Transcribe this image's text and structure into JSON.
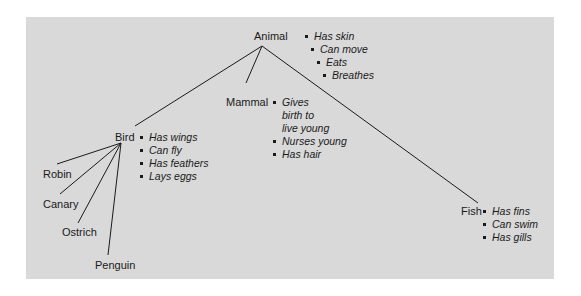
{
  "diagram": {
    "type": "semantic-network-hierarchy",
    "background_color": "#d9d9d9",
    "nodes": [
      {
        "id": "animal",
        "label": "Animal",
        "properties": [
          "Has skin",
          "Can move",
          "Eats",
          "Breathes"
        ]
      },
      {
        "id": "bird",
        "label": "Bird",
        "parent": "animal",
        "properties": [
          "Has wings",
          "Can fly",
          "Has feathers",
          "Lays eggs"
        ]
      },
      {
        "id": "mammal",
        "label": "Mammal",
        "parent": "animal",
        "properties": [
          "Gives birth to live young",
          "Nurses young",
          "Has hair"
        ]
      },
      {
        "id": "fish",
        "label": "Fish",
        "parent": "animal",
        "properties": [
          "Has fins",
          "Can swim",
          "Has gills"
        ]
      },
      {
        "id": "robin",
        "label": "Robin",
        "parent": "bird"
      },
      {
        "id": "canary",
        "label": "Canary",
        "parent": "bird"
      },
      {
        "id": "ostrich",
        "label": "Ostrich",
        "parent": "bird"
      },
      {
        "id": "penguin",
        "label": "Penguin",
        "parent": "bird"
      }
    ]
  },
  "labels": {
    "animal": "Animal",
    "bird": "Bird",
    "mammal": "Mammal",
    "fish": "Fish",
    "robin": "Robin",
    "canary": "Canary",
    "ostrich": "Ostrich",
    "penguin": "Penguin"
  },
  "props": {
    "animal": [
      "Has skin",
      "Can move",
      "Eats",
      "Breathes"
    ],
    "bird": [
      "Has wings",
      "Can fly",
      "Has feathers",
      "Lays eggs"
    ],
    "mammal": [
      "Gives",
      "birth to",
      "live young",
      "Nurses young",
      "Has hair"
    ],
    "fish": [
      "Has fins",
      "Can swim",
      "Has gills"
    ]
  }
}
